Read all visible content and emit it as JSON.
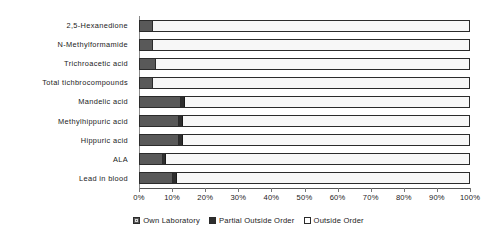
{
  "chart_data": {
    "type": "bar",
    "orientation": "horizontal",
    "stacked": true,
    "stack_mode": "percent",
    "title": "",
    "subtitle": "",
    "xlabel": "",
    "ylabel": "",
    "xlim": [
      0,
      100
    ],
    "grid": false,
    "legend_position": "bottom",
    "categories": [
      "2,5-Hexanedione",
      "N-Methylformamide",
      "Trichroacetic acid",
      "Total tichbrocompounds",
      "Mandelic acid",
      "Methylhippuric acid",
      "Hippuric acid",
      "ALA",
      "Lead in blood"
    ],
    "series": [
      {
        "name": "Own Laboratory",
        "color": "#595959",
        "values": [
          4.0,
          4.0,
          5.0,
          4.0,
          12.4,
          11.8,
          11.8,
          7.0,
          10.0
        ]
      },
      {
        "name": "Partial Outside Order",
        "color": "#2e2e2e",
        "values": [
          0.0,
          0.0,
          0.0,
          0.0,
          1.2,
          1.2,
          1.2,
          1.0,
          1.3
        ]
      },
      {
        "name": "Outside Order",
        "color": "#f7f7f7",
        "values": [
          96.0,
          96.0,
          95.0,
          96.0,
          86.4,
          87.0,
          87.0,
          92.0,
          88.7
        ]
      }
    ],
    "xticks": [
      0,
      10,
      20,
      30,
      40,
      50,
      60,
      70,
      80,
      90,
      100
    ],
    "xtick_labels": [
      "0%",
      "10%",
      "20%",
      "30%",
      "40%",
      "50%",
      "60%",
      "70%",
      "80%",
      "90%",
      "100%"
    ]
  },
  "legend": {
    "items": [
      {
        "label": "Own Laboratory",
        "swatch": "own-laboratory-swatch-icon"
      },
      {
        "label": "Partial Outside Order",
        "swatch": "partial-outside-order-swatch-icon"
      },
      {
        "label": "Outside Order",
        "swatch": "outside-order-swatch-icon"
      }
    ]
  }
}
